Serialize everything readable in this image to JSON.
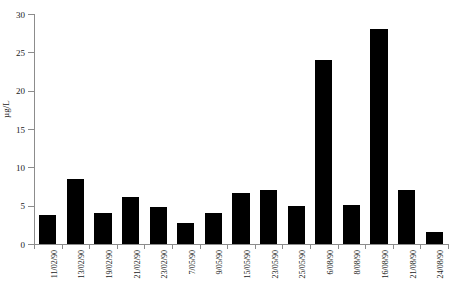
{
  "chart_data": {
    "type": "bar",
    "title": "",
    "subtitle": "",
    "xlabel": "",
    "ylabel": "µg/L",
    "ylim": [
      0,
      30
    ],
    "yticks": [
      0,
      5,
      10,
      15,
      20,
      25,
      30
    ],
    "ytick_labels": [
      "0",
      "5",
      "10",
      "15",
      "20",
      "25",
      "30"
    ],
    "grid": false,
    "legend": null,
    "bar_color": "#000000",
    "axis_color": "#8c8c8c",
    "categories": [
      "11/02/90",
      "13/02/90",
      "19/02/90",
      "21/02/90",
      "23/02/90",
      "7/05/90",
      "9/05/90",
      "15/05/90",
      "23/05/90",
      "25/05/90",
      "6/08/90",
      "8/08/90",
      "16/08/90",
      "21/08/90",
      "24/08/90"
    ],
    "values": [
      3.8,
      8.5,
      4.0,
      6.1,
      4.8,
      2.7,
      4.1,
      6.6,
      7.1,
      5.0,
      24.0,
      5.1,
      28.0,
      7.1,
      1.6
    ],
    "annotations": []
  }
}
